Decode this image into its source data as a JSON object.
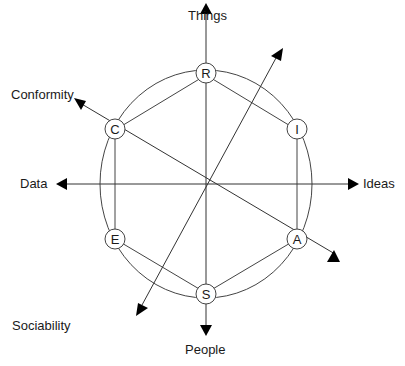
{
  "diagram": {
    "type": "hexagon-wheel",
    "nodes": [
      {
        "id": "R",
        "label": "R"
      },
      {
        "id": "I",
        "label": "I"
      },
      {
        "id": "A",
        "label": "A"
      },
      {
        "id": "S",
        "label": "S"
      },
      {
        "id": "E",
        "label": "E"
      },
      {
        "id": "C",
        "label": "C"
      }
    ],
    "axes": {
      "things": "Things",
      "people": "People",
      "ideas": "Ideas",
      "data": "Data",
      "conformity": "Conformity",
      "sociability": "Sociability"
    },
    "colors": {
      "line": "#333333",
      "arrow": "#000000",
      "node_fill": "#ffffff"
    }
  }
}
